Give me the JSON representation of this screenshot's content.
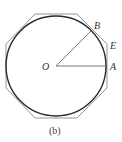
{
  "figure": {
    "caption": "(b)",
    "labels": {
      "O": "O",
      "A": "A",
      "B": "B",
      "E": "E"
    },
    "circle": {
      "cx": 56,
      "cy": 66,
      "r": 50,
      "color": "#2a2a2a"
    },
    "octagon": {
      "color": "#8a8a8a",
      "points": "35,14 77,14 107,44 107,88 77,118 35,118 6,88 6,44"
    },
    "segments": {
      "OA": {
        "x1": 56,
        "y1": 66,
        "x2": 106,
        "y2": 66
      },
      "OB": {
        "x1": 56,
        "y1": 66,
        "x2": 91,
        "y2": 31
      }
    },
    "line_color": "#555555"
  }
}
